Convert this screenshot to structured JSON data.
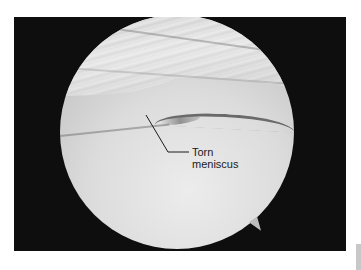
{
  "figure": {
    "type": "arthroscopic-view",
    "annotation": {
      "line1": "Torn",
      "line2": "meniscus"
    },
    "colors": {
      "frame_background": "#0e0e0e",
      "scope_field": "#dcdcdc",
      "annotation_text": "#1a1a1a"
    }
  }
}
